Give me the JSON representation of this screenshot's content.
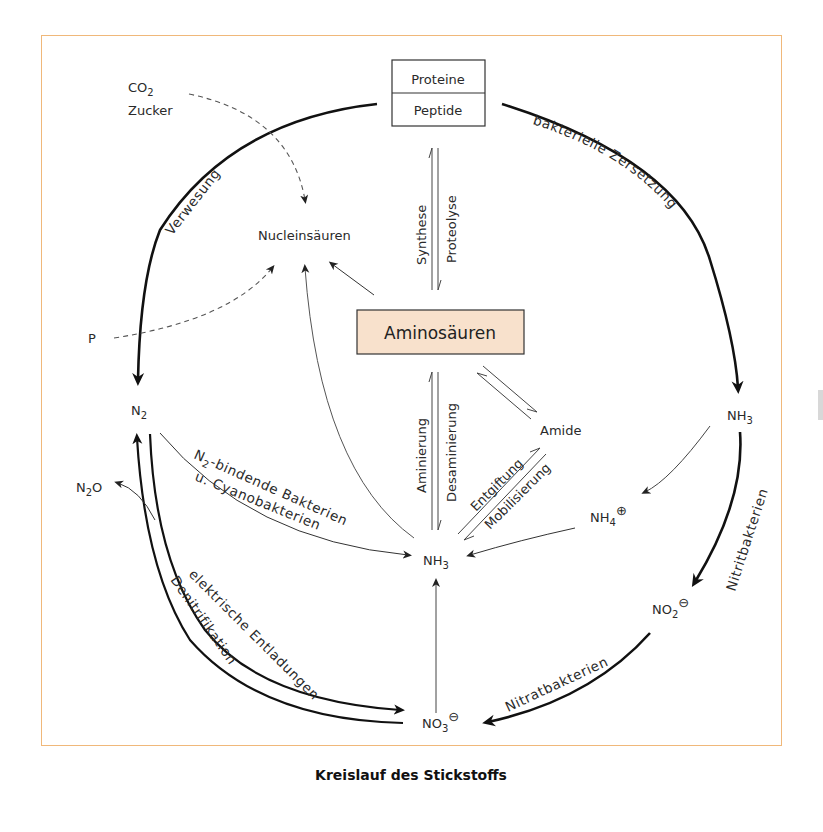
{
  "title": "Kreislauf des Stickstoffs",
  "colors": {
    "frame_border": "#f0b87a",
    "amino_box_fill": "#f8e1cc",
    "line": "#111111",
    "thin_line": "#444444",
    "text": "#2a2a2a"
  },
  "nodes": {
    "proteine": "Proteine",
    "peptide": "Peptide",
    "aminosaeuren": "Aminosäuren",
    "nucleinsaeuren": "Nucleinsäuren",
    "co2": "CO",
    "co2_sub": "2",
    "zucker": "Zucker",
    "p": "P",
    "n2": "N",
    "n2_sub": "2",
    "n2o": "N",
    "n2o_sub": "2",
    "n2o_tail": "O",
    "nh3_right": "NH",
    "nh3_right_sub": "3",
    "nh3_center": "NH",
    "nh3_center_sub": "3",
    "nh4": "NH",
    "nh4_sub": "4",
    "nh4_charge": "⊕",
    "no2": "NO",
    "no2_sub": "2",
    "no2_charge": "⊖",
    "no3": "NO",
    "no3_sub": "3",
    "no3_charge": "⊖",
    "amide": "Amide"
  },
  "edges": {
    "verwesung": "Verwesung",
    "bakterielle_zersetzung": "bakterielle Zersetzung",
    "nitritbakterien": "Nitritbakterien",
    "nitratbakterien": "Nitratbakterien",
    "denitrifikation": "Denitrifikation",
    "elektrische_entladungen": "elektrische Entladungen",
    "n2_bindende_1": "N",
    "n2_bindende_sub": "2",
    "n2_bindende_2": "-bindende Bakterien",
    "cyanobakterien": "u. Cyanobakterien",
    "synthese": "Synthese",
    "proteolyse": "Proteolyse",
    "aminierung": "Aminierung",
    "desaminierung": "Desaminierung",
    "entgiftung": "Entgiftung",
    "mobilisierung": "Mobilisierung"
  }
}
